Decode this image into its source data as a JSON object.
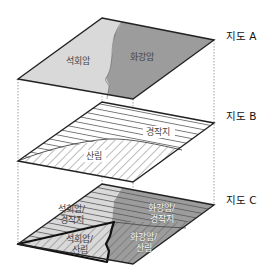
{
  "colors": {
    "limestone": "#d9d9d9",
    "granite": "#9c9c9c",
    "outline": "#222222",
    "hatch": "#555555",
    "guide": "#888888"
  },
  "maps": [
    {
      "id": "A",
      "label": "지도 A",
      "theme": "rock type",
      "regions": [
        {
          "name": "limestone",
          "label": "석회암"
        },
        {
          "name": "granite",
          "label": "화강암"
        }
      ]
    },
    {
      "id": "B",
      "label": "지도 B",
      "theme": "land use",
      "regions": [
        {
          "name": "cultivated",
          "label": "경작지"
        },
        {
          "name": "forest",
          "label": "산림"
        }
      ]
    },
    {
      "id": "C",
      "label": "지도 C",
      "theme": "overlay result",
      "regions": [
        {
          "name": "limestone-cultivated",
          "label_line1": "석회암/",
          "label_line2": "경작지"
        },
        {
          "name": "granite-cultivated",
          "label_line1": "화강암/",
          "label_line2": "경작지"
        },
        {
          "name": "limestone-forest",
          "label_line1": "석회암/",
          "label_line2": "산림",
          "highlighted": true
        },
        {
          "name": "granite-forest",
          "label_line1": "화강암/",
          "label_line2": "산림"
        }
      ]
    }
  ]
}
